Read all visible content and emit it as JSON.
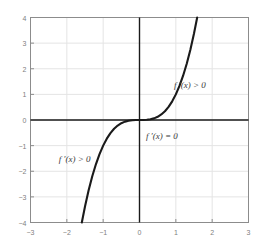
{
  "chart_data": {
    "type": "line",
    "title": "",
    "xlabel": "",
    "ylabel": "",
    "xlim": [
      -3,
      3
    ],
    "ylim": [
      -4,
      4
    ],
    "grid": true,
    "legend_position": "none",
    "function": "y = x^3",
    "series": [
      {
        "name": "f(x) = x^3",
        "color": "#1a1a1a",
        "x": [
          -1.5874,
          -1.5,
          -1.4,
          -1.3,
          -1.2,
          -1.1,
          -1.0,
          -0.9,
          -0.8,
          -0.7,
          -0.6,
          -0.5,
          -0.4,
          -0.3,
          -0.2,
          -0.1,
          0.0,
          0.1,
          0.2,
          0.3,
          0.4,
          0.5,
          0.6,
          0.7,
          0.8,
          0.9,
          1.0,
          1.1,
          1.2,
          1.3,
          1.4,
          1.5,
          1.5874
        ],
        "values": [
          -4.0,
          -3.375,
          -2.744,
          -2.197,
          -1.728,
          -1.331,
          -1.0,
          -0.729,
          -0.512,
          -0.343,
          -0.216,
          -0.125,
          -0.064,
          -0.027,
          -0.008,
          -0.001,
          0.0,
          0.001,
          0.008,
          0.027,
          0.064,
          0.125,
          0.216,
          0.343,
          0.512,
          0.729,
          1.0,
          1.331,
          1.728,
          2.197,
          2.744,
          3.375,
          4.0
        ]
      }
    ],
    "x_ticks": [
      {
        "value": -3,
        "label": "−3"
      },
      {
        "value": -2,
        "label": "−2"
      },
      {
        "value": -1,
        "label": "−1"
      },
      {
        "value": 0,
        "label": "0"
      },
      {
        "value": 1,
        "label": "1"
      },
      {
        "value": 2,
        "label": "2"
      },
      {
        "value": 3,
        "label": "3"
      }
    ],
    "y_ticks": [
      {
        "value": 4,
        "label": "4"
      },
      {
        "value": 3,
        "label": "3"
      },
      {
        "value": 2,
        "label": "2"
      },
      {
        "value": 1,
        "label": "1"
      },
      {
        "value": 0,
        "label": "0"
      },
      {
        "value": -1,
        "label": "−1"
      },
      {
        "value": -2,
        "label": "−2"
      },
      {
        "value": -3,
        "label": "−3"
      },
      {
        "value": -4,
        "label": "−4"
      }
    ],
    "annotations": [
      {
        "name": "upper-right",
        "text": "f ′(x) > 0",
        "x": 0.95,
        "y": 1.35
      },
      {
        "name": "origin",
        "text": "f ′(x) = 0",
        "x": 0.18,
        "y": -0.62
      },
      {
        "name": "lower-left",
        "text": "f ′(x) > 0",
        "x": -2.22,
        "y": -1.52
      }
    ]
  },
  "style": {
    "axis_color": "#1a1a1a",
    "grid_color": "#e4e4e4",
    "frame_color": "#8c8c8c",
    "tick_label_color": "#808080",
    "annotation_color": "#3a3a3a",
    "curve_color": "#1a1a1a",
    "background": "#ffffff"
  }
}
